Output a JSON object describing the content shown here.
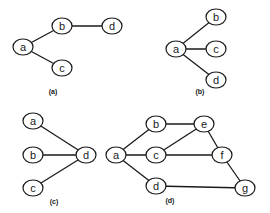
{
  "diagram": {
    "node_style": {
      "rx": 10,
      "ry": 8,
      "stroke": "#1a1a1a",
      "fill": "#ffffff"
    },
    "graphs": [
      {
        "id": "a",
        "caption": "(a)",
        "caption_pos": [
          53,
          94
        ],
        "nodes": [
          {
            "id": "a",
            "label": "a",
            "x": 23,
            "y": 47
          },
          {
            "id": "b",
            "label": "b",
            "x": 62,
            "y": 26
          },
          {
            "id": "c",
            "label": "c",
            "x": 62,
            "y": 68
          },
          {
            "id": "d",
            "label": "d",
            "x": 112,
            "y": 26
          }
        ],
        "edges": [
          [
            "a",
            "b"
          ],
          [
            "a",
            "c"
          ],
          [
            "b",
            "d"
          ]
        ]
      },
      {
        "id": "b",
        "caption": "(b)",
        "caption_pos": [
          200,
          94
        ],
        "nodes": [
          {
            "id": "a",
            "label": "a",
            "x": 176,
            "y": 49
          },
          {
            "id": "b",
            "label": "b",
            "x": 216,
            "y": 17
          },
          {
            "id": "c",
            "label": "c",
            "x": 216,
            "y": 49
          },
          {
            "id": "d",
            "label": "d",
            "x": 216,
            "y": 80
          }
        ],
        "edges": [
          [
            "a",
            "b"
          ],
          [
            "a",
            "c"
          ],
          [
            "a",
            "d"
          ]
        ]
      },
      {
        "id": "c",
        "caption": "(c)",
        "caption_pos": [
          54,
          204
        ],
        "nodes": [
          {
            "id": "a",
            "label": "a",
            "x": 33,
            "y": 121
          },
          {
            "id": "b",
            "label": "b",
            "x": 33,
            "y": 155
          },
          {
            "id": "c",
            "label": "c",
            "x": 33,
            "y": 188
          },
          {
            "id": "d",
            "label": "d",
            "x": 86,
            "y": 155
          }
        ],
        "edges": [
          [
            "a",
            "d"
          ],
          [
            "b",
            "d"
          ],
          [
            "c",
            "d"
          ]
        ]
      },
      {
        "id": "d",
        "caption": "(d)",
        "caption_pos": [
          170,
          203
        ],
        "nodes": [
          {
            "id": "a",
            "label": "a",
            "x": 116,
            "y": 155
          },
          {
            "id": "b",
            "label": "b",
            "x": 156,
            "y": 124
          },
          {
            "id": "c",
            "label": "c",
            "x": 156,
            "y": 155
          },
          {
            "id": "d",
            "label": "d",
            "x": 156,
            "y": 186
          },
          {
            "id": "e",
            "label": "e",
            "x": 204,
            "y": 124
          },
          {
            "id": "f",
            "label": "f",
            "x": 222,
            "y": 155
          },
          {
            "id": "g",
            "label": "g",
            "x": 245,
            "y": 188
          }
        ],
        "edges": [
          [
            "a",
            "b"
          ],
          [
            "a",
            "c"
          ],
          [
            "a",
            "d"
          ],
          [
            "b",
            "e"
          ],
          [
            "c",
            "e"
          ],
          [
            "c",
            "f"
          ],
          [
            "e",
            "f"
          ],
          [
            "f",
            "g"
          ],
          [
            "d",
            "g"
          ]
        ]
      }
    ]
  }
}
